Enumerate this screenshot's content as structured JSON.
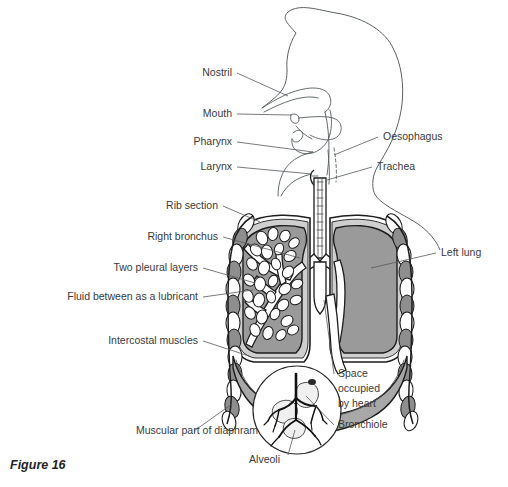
{
  "figure": {
    "caption": "Figure 16"
  },
  "colors": {
    "lung_fill": "#9a9a9a",
    "diaphragm_fill": "#a8a8a8",
    "pleura_fill": "#cfcfcf",
    "outline": "#1d1d1d",
    "body_outline": "#5a6063",
    "label_text": "#3a3a3a",
    "leader_line": "#555b5e",
    "background": "#ffffff"
  },
  "labels_left": [
    {
      "id": "nostril",
      "text": "Nostril",
      "x": 232,
      "y": 76,
      "lx1": 237,
      "ly1": 73,
      "lx2": 288,
      "ly2": 96
    },
    {
      "id": "mouth",
      "text": "Mouth",
      "x": 232,
      "y": 117,
      "lx1": 237,
      "ly1": 114,
      "lx2": 291,
      "ly2": 115
    },
    {
      "id": "pharynx",
      "text": "Pharynx",
      "x": 232,
      "y": 145,
      "lx1": 237,
      "ly1": 142,
      "lx2": 313,
      "ly2": 152
    },
    {
      "id": "larynx",
      "text": "Larynx",
      "x": 232,
      "y": 170,
      "lx1": 237,
      "ly1": 167,
      "lx2": 312,
      "ly2": 174
    },
    {
      "id": "rib-section",
      "text": "Rib section",
      "x": 218,
      "y": 209,
      "lx1": 223,
      "ly1": 206,
      "lx2": 260,
      "ly2": 222
    },
    {
      "id": "right-bronchus",
      "text": "Right bronchus",
      "x": 218,
      "y": 240,
      "lx1": 223,
      "ly1": 237,
      "lx2": 300,
      "ly2": 258
    },
    {
      "id": "two-pleural",
      "text": "Two pleural layers",
      "x": 198,
      "y": 271,
      "lx1": 203,
      "ly1": 268,
      "lx2": 255,
      "ly2": 283
    },
    {
      "id": "fluid-lub",
      "text": "Fluid between as a lubricant",
      "x": 198,
      "y": 300,
      "lx1": 203,
      "ly1": 297,
      "lx2": 253,
      "ly2": 290
    },
    {
      "id": "intercostal",
      "text": "Intercostal muscles",
      "x": 198,
      "y": 344,
      "lx1": 203,
      "ly1": 341,
      "lx2": 249,
      "ly2": 356
    },
    {
      "id": "diaphram",
      "text": "Muscular part of diaphram",
      "x": 258,
      "y": 434,
      "lx1": 194,
      "ly1": 431,
      "lx2": 232,
      "ly2": 404
    }
  ],
  "labels_right": [
    {
      "id": "oesophagus",
      "text": "Oesophagus",
      "x": 383,
      "y": 140,
      "lx1": 378,
      "ly1": 137,
      "lx2": 334,
      "ly2": 155
    },
    {
      "id": "trachea",
      "text": "Trachea",
      "x": 377,
      "y": 170,
      "lx1": 372,
      "ly1": 167,
      "lx2": 327,
      "ly2": 180
    },
    {
      "id": "left-lung",
      "text": "Left lung",
      "x": 441,
      "y": 256,
      "lx1": 436,
      "ly1": 253,
      "lx2": 371,
      "ly2": 268
    },
    {
      "id": "space-heart-1",
      "text": "Space",
      "x": 338,
      "y": 377,
      "lx1": 334,
      "ly1": 374,
      "lx2": 324,
      "ly2": 300
    },
    {
      "id": "space-heart-2",
      "text": "occupied",
      "x": 338,
      "y": 392,
      "lx1": null,
      "ly1": null,
      "lx2": null,
      "ly2": null
    },
    {
      "id": "space-heart-3",
      "text": "by heart",
      "x": 338,
      "y": 407,
      "lx1": null,
      "ly1": null,
      "lx2": null,
      "ly2": null
    },
    {
      "id": "bronchiole",
      "text": "Bronchiole",
      "x": 338,
      "y": 428,
      "lx1": 334,
      "ly1": 425,
      "lx2": 306,
      "ly2": 396
    }
  ],
  "labels_bottom": [
    {
      "id": "alveoli",
      "text": "Alveoli",
      "x": 280,
      "y": 463,
      "lx1": 288,
      "ly1": 455,
      "lx2": 295,
      "ly2": 430
    }
  ],
  "anatomy_parts": [
    "head-outline",
    "nasal-cavity",
    "oral-cavity",
    "tongue",
    "pharynx-cavity",
    "larynx",
    "trachea",
    "oesophagus",
    "right-bronchus",
    "left-bronchus",
    "right-lung-bronchial-tree",
    "left-lung",
    "rib-cage-left",
    "rib-cage-right",
    "pleural-membrane",
    "diaphragm",
    "heart-space",
    "alveoli-inset"
  ],
  "inset": {
    "name": "alveoli-detail-circle",
    "cx": 297,
    "cy": 410,
    "r": 44
  }
}
